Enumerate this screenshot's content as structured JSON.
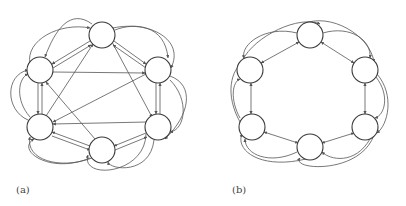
{
  "figure": {
    "panels": [
      {
        "label": "(a)",
        "description": "Directed graph on 6 nodes arranged in a hexagon, with bidirectional edges between neighbors (parallel doubled), chords, and outer curved arcs",
        "nodes": [
          {
            "id": "a-top",
            "cx": 102,
            "cy": 35
          },
          {
            "id": "a-right-top",
            "cx": 158,
            "cy": 70
          },
          {
            "id": "a-right-bottom",
            "cx": 158,
            "cy": 127
          },
          {
            "id": "a-bottom",
            "cx": 102,
            "cy": 150
          },
          {
            "id": "a-left-bottom",
            "cx": 40,
            "cy": 127
          },
          {
            "id": "a-left-top",
            "cx": 40,
            "cy": 70
          }
        ],
        "node_radius": 13
      },
      {
        "label": "(b)",
        "description": "Directed graph on 6 nodes arranged in a hexagon, with bidirectional edges between adjacent nodes and outer curved arcs connecting nodes two apart",
        "nodes": [
          {
            "id": "b-top",
            "cx": 310,
            "cy": 35
          },
          {
            "id": "b-right-top",
            "cx": 365,
            "cy": 70
          },
          {
            "id": "b-right-bottom",
            "cx": 365,
            "cy": 127
          },
          {
            "id": "b-bottom",
            "cx": 310,
            "cy": 147
          },
          {
            "id": "b-left-bottom",
            "cx": 252,
            "cy": 127
          },
          {
            "id": "b-left-top",
            "cx": 250,
            "cy": 70
          }
        ],
        "node_radius": 13
      }
    ]
  },
  "labels": {
    "a": "(a)",
    "b": "(b)"
  },
  "colors": {
    "node_stroke": "#3a3a3a",
    "edge_stroke": "#555555",
    "background": "#ffffff"
  }
}
